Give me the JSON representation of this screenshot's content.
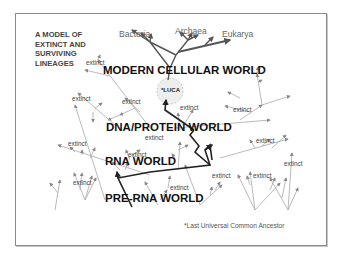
{
  "title": "A MODEL OF EXTINCT AND SURVIVING LINEAGES",
  "domains": [
    {
      "label": "Bacteria",
      "x": 119,
      "y": 29
    },
    {
      "label": "Archaea",
      "x": 175,
      "y": 26
    },
    {
      "label": "Eukarya",
      "x": 222,
      "y": 29
    }
  ],
  "worlds": [
    {
      "label": "MODERN CELLULAR WORLD",
      "x": 103,
      "y": 69
    },
    {
      "label": "DNA/PROTEIN WORLD",
      "x": 106,
      "y": 118
    },
    {
      "label": "RNA WORLD",
      "x": 105,
      "y": 156
    },
    {
      "label": "PRE-RNA WORLD",
      "x": 105,
      "y": 185
    }
  ],
  "luca_label": "*LUCA",
  "extinct_labels": [
    {
      "text": "extinct",
      "x": 86,
      "y": 57
    },
    {
      "text": "extinct",
      "x": 72,
      "y": 95
    },
    {
      "text": "extinct",
      "x": 122,
      "y": 98
    },
    {
      "text": "extinct",
      "x": 180,
      "y": 106
    },
    {
      "text": "extinct",
      "x": 233,
      "y": 107
    },
    {
      "text": "extinct",
      "x": 144,
      "y": 133
    },
    {
      "text": "extinct",
      "x": 68,
      "y": 139
    },
    {
      "text": "extinct",
      "x": 128,
      "y": 151
    },
    {
      "text": "extinct",
      "x": 256,
      "y": 139
    },
    {
      "text": "extinct",
      "x": 284,
      "y": 160
    },
    {
      "text": "extinct",
      "x": 73,
      "y": 177
    },
    {
      "text": "extinct",
      "x": 212,
      "y": 172
    },
    {
      "text": "extinct",
      "x": 253,
      "y": 172
    },
    {
      "text": "extinct",
      "x": 170,
      "y": 182
    }
  ],
  "footnote": "*Last Universal Common Ancestor",
  "colors": {
    "main_lineage": "#222222",
    "surviving_branch": "#555555",
    "extinct_branch": "#a8a8a8",
    "frame": "#8a8a8a",
    "luca_circle": "#dddddd"
  }
}
